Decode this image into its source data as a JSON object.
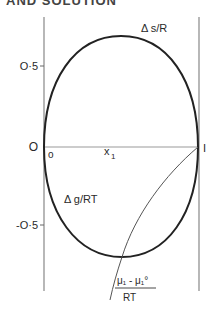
{
  "header": {
    "cutoff_text": "AND SOLUTION"
  },
  "diagram": {
    "type": "thermodynamic-mixing-plot",
    "y_ticks": [
      {
        "label": "O·5",
        "value": 0.5
      },
      {
        "label": "O",
        "value": 0
      },
      {
        "label": "-O·5",
        "value": -0.5
      }
    ],
    "x_axis": {
      "origin_label": "o",
      "end_label": "I",
      "variable_label": "x",
      "variable_subscript": "1"
    },
    "curves": [
      {
        "name": "entropy-of-mixing",
        "label": "Δ s/R"
      },
      {
        "name": "gibbs-energy-of-mixing",
        "label": "Δ g/RT"
      },
      {
        "name": "chemical-potential",
        "numerator": "μ₁ - μ₁°",
        "denominator": "RT"
      }
    ],
    "colors": {
      "ink": "#2a2a2a",
      "thin_line": "#555555",
      "axis": "#888888"
    }
  }
}
